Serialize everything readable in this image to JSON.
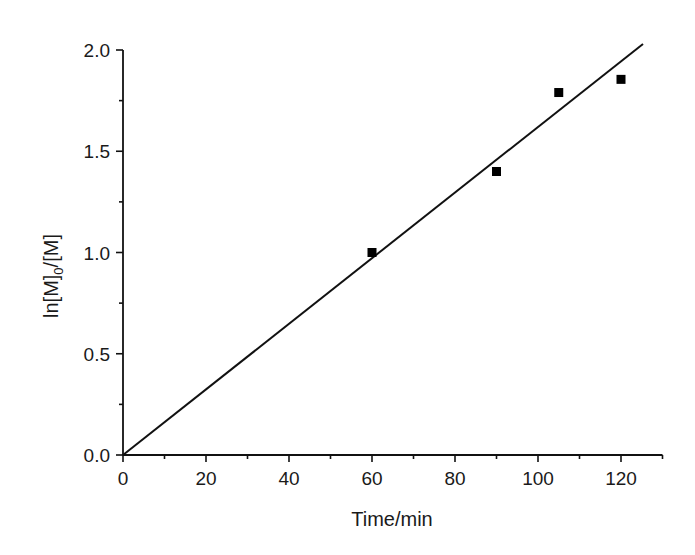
{
  "chart_data": {
    "type": "scatter",
    "title": "",
    "xlabel": "Time/min",
    "ylabel": "ln[M]0/[M]",
    "ylabel_parts": {
      "main": "ln[M]",
      "subscript": "0",
      "tail": "/[M]"
    },
    "xlim": [
      0,
      130
    ],
    "ylim": [
      0,
      2.0
    ],
    "xticks": [
      0,
      20,
      40,
      60,
      80,
      100,
      120
    ],
    "xtick_labels": [
      "0",
      "20",
      "40",
      "60",
      "80",
      "100",
      "120"
    ],
    "xminor": [
      10,
      30,
      50,
      70,
      90,
      110,
      130
    ],
    "yticks": [
      0,
      0.5,
      1.0,
      1.5,
      2.0
    ],
    "ytick_labels": [
      "0.0",
      "0.5",
      "1.0",
      "1.5",
      "2.0"
    ],
    "yminor": [
      0.25,
      0.75,
      1.25,
      1.75
    ],
    "grid": false,
    "legend": null,
    "series": [
      {
        "name": "data",
        "marker": "square",
        "color": "#000000",
        "x": [
          60,
          90,
          105,
          120
        ],
        "y": [
          1.0,
          1.4,
          1.79,
          1.855
        ]
      }
    ],
    "fit_line": {
      "type": "linear",
      "slope": 0.0162,
      "intercept": 0,
      "x_start": 0,
      "x_end": 125.3,
      "color": "#000000"
    }
  }
}
